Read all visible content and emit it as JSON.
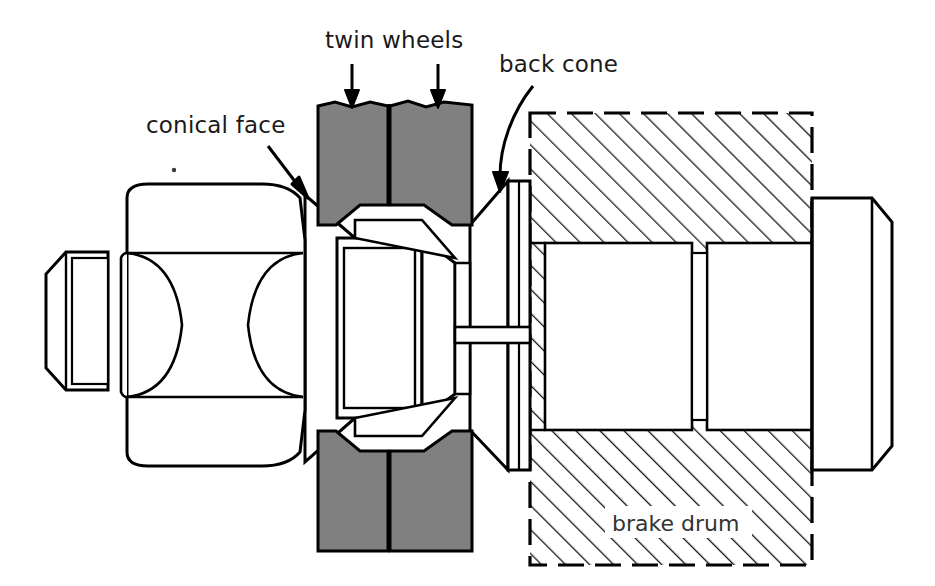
{
  "figure": {
    "kind": "engineering-cross-section",
    "background_color": "#ffffff",
    "line_color": "#000000",
    "wheel_fill": "#808080",
    "hatch_color": "#1a1a1a",
    "label_color": "#1a1a1a"
  },
  "labels": {
    "conical_face": "conical face",
    "twin_wheels": "twin wheels",
    "back_cone": "back cone",
    "brake_drum": "brake drum"
  },
  "annotations": [
    {
      "id": "conical-face",
      "text": "conical face",
      "text_x": 146,
      "text_y": 133,
      "leader": "straight",
      "arrow_from": [
        270,
        148
      ],
      "arrow_to": [
        307,
        193
      ]
    },
    {
      "id": "twin-wheels",
      "text": "twin wheels",
      "text_x": 325,
      "text_y": 48,
      "leader": "straight-double",
      "arrow_from": [
        352,
        62
      ],
      "arrow_to": [
        352,
        104
      ],
      "arrow2_from": [
        438,
        62
      ],
      "arrow2_to": [
        438,
        104
      ]
    },
    {
      "id": "back-cone",
      "text": "back cone",
      "text_x": 499,
      "text_y": 72,
      "leader": "curved",
      "arrow_from": [
        530,
        88
      ],
      "arrow_to": [
        504,
        190
      ]
    },
    {
      "id": "brake-drum",
      "text": "brake drum",
      "text_x": 615,
      "text_y": 530,
      "leader": "none"
    }
  ],
  "parts": {
    "left_stub": {
      "name": "left shaft stub",
      "x": 44,
      "y": 252,
      "w": 62,
      "h": 138
    },
    "hex_nut": {
      "name": "hexagonal nut body",
      "x": 105,
      "y": 184,
      "w": 200,
      "h": 280
    },
    "conical_face_wedge": {
      "name": "conical face wedge"
    },
    "twin_wheel_upper_left": {
      "name": "twin wheel upper left",
      "fill": "#808080"
    },
    "twin_wheel_upper_right": {
      "name": "twin wheel upper right",
      "fill": "#808080"
    },
    "twin_wheel_lower_left": {
      "name": "twin wheel lower left",
      "fill": "#808080"
    },
    "twin_wheel_lower_right": {
      "name": "twin wheel lower right",
      "fill": "#808080"
    },
    "back_cone_body": {
      "name": "back cone",
      "x": 470,
      "y": 180,
      "w": 60,
      "h": 290
    },
    "brake_drum_body": {
      "name": "brake drum hatched section",
      "x": 530,
      "y": 113,
      "w": 282,
      "h": 452,
      "border": "dashed"
    },
    "drum_cavity_left": {
      "name": "drum cavity left",
      "x": 545,
      "y": 243,
      "w": 147,
      "h": 187
    },
    "drum_cavity_right": {
      "name": "drum cavity right",
      "x": 707,
      "y": 243,
      "w": 105,
      "h": 187
    },
    "right_stub": {
      "name": "right shaft stub",
      "x": 820,
      "y": 198,
      "w": 72,
      "h": 272
    },
    "axle_line": {
      "name": "axle centreline band",
      "y": 327,
      "h": 16
    }
  }
}
